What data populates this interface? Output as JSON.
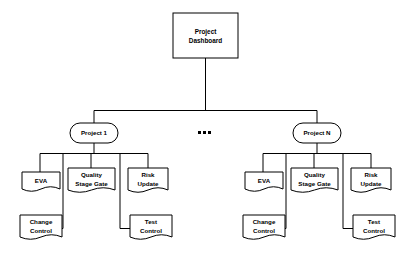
{
  "diagram": {
    "type": "tree-hierarchy",
    "colors": {
      "background": "#ffffff",
      "stroke": "#000000",
      "shape_fill": "#ffffff",
      "text": "#000000"
    },
    "root": {
      "id": "project-dashboard",
      "shape": "rectangle",
      "line1": "Project",
      "line2": "Dashboard"
    },
    "ellipsis": {
      "id": "ellipsis",
      "glyph": "•••",
      "dots": 3
    },
    "branches": [
      {
        "id": "project-1",
        "shape": "rounded-rectangle",
        "label": "Project  1",
        "documents": [
          {
            "id": "eva-1",
            "shape": "document",
            "line1": "EVA",
            "line2": ""
          },
          {
            "id": "quality-stage-gate-1",
            "shape": "document",
            "line1": "Quality",
            "line2": "Stage  Gate"
          },
          {
            "id": "risk-update-1",
            "shape": "document",
            "line1": "Risk",
            "line2": "Update"
          },
          {
            "id": "change-control-1",
            "shape": "document",
            "line1": "Change",
            "line2": "Control"
          },
          {
            "id": "test-control-1",
            "shape": "document",
            "line1": "Test",
            "line2": "Control"
          }
        ]
      },
      {
        "id": "project-n",
        "shape": "rounded-rectangle",
        "label": "Project  N",
        "documents": [
          {
            "id": "eva-n",
            "shape": "document",
            "line1": "EVA",
            "line2": ""
          },
          {
            "id": "quality-stage-gate-n",
            "shape": "document",
            "line1": "Quality",
            "line2": "Stage  Gate"
          },
          {
            "id": "risk-update-n",
            "shape": "document",
            "line1": "Risk",
            "line2": "Update"
          },
          {
            "id": "change-control-n",
            "shape": "document",
            "line1": "Change",
            "line2": "Control"
          },
          {
            "id": "test-control-n",
            "shape": "document",
            "line1": "Test",
            "line2": "Control"
          }
        ]
      }
    ]
  }
}
